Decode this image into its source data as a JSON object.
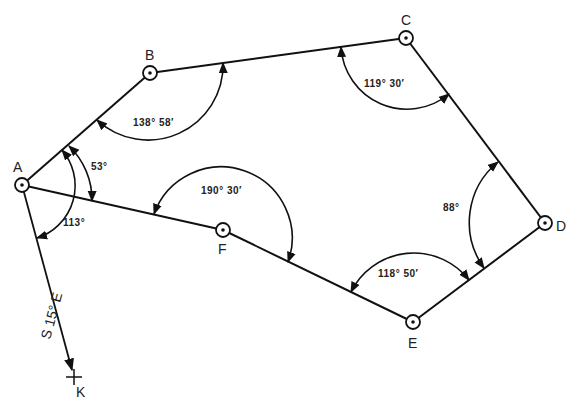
{
  "diagram": {
    "type": "traverse-survey",
    "stations": [
      {
        "id": "A",
        "label": "A",
        "x": 22,
        "y": 185
      },
      {
        "id": "B",
        "label": "B",
        "x": 150,
        "y": 73
      },
      {
        "id": "C",
        "label": "C",
        "x": 406,
        "y": 38
      },
      {
        "id": "D",
        "label": "D",
        "x": 545,
        "y": 223
      },
      {
        "id": "E",
        "label": "E",
        "x": 413,
        "y": 322
      },
      {
        "id": "F",
        "label": "F",
        "x": 223,
        "y": 230
      }
    ],
    "reference_point": {
      "id": "K",
      "label": "K",
      "x": 74,
      "y": 377
    },
    "bearing": {
      "label": "S 15° E",
      "from": "A",
      "to": "K"
    },
    "angles": [
      {
        "station": "A",
        "label": "53°",
        "between": "B-F"
      },
      {
        "station": "A",
        "label": "113°",
        "between": "B-K"
      },
      {
        "station": "B",
        "label": "138° 58′"
      },
      {
        "station": "C",
        "label": "119° 30′"
      },
      {
        "station": "D",
        "label": "88°"
      },
      {
        "station": "E",
        "label": "118° 50′"
      },
      {
        "station": "F",
        "label": "190° 30′"
      }
    ],
    "colors": {
      "line": "#111111",
      "background": "#ffffff"
    }
  }
}
